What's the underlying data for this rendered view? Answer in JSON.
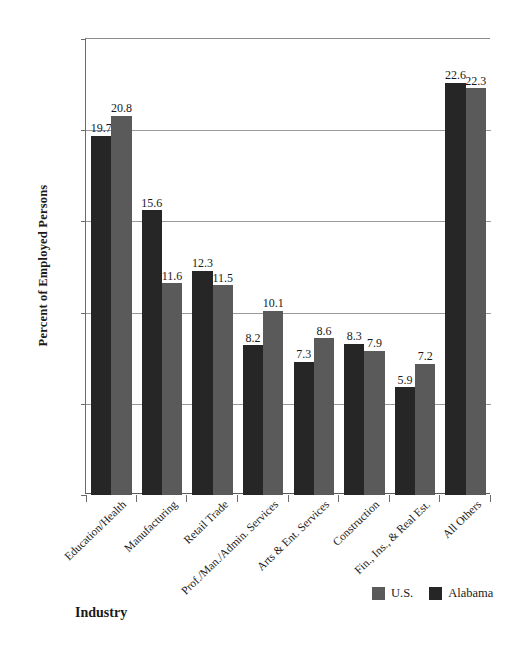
{
  "chart_data": {
    "type": "bar",
    "title": "",
    "xlabel": "Industry",
    "ylabel": "Percent of Employed Persons",
    "ylim": [
      0,
      25
    ],
    "yticks": [
      "0",
      "5",
      "10",
      "15",
      "20",
      "25"
    ],
    "grid": true,
    "legend_position": "bottom-right",
    "categories": [
      "Education/Health",
      "Manufacturing",
      "Retail Trade",
      "Prof./Man./Admin. Services",
      "Arts & Ent. Services",
      "Construction",
      "Fin., Ins., & Real Est.",
      "All Others"
    ],
    "series": [
      {
        "name": "Alabama",
        "color": "#262626",
        "values": [
          19.7,
          15.6,
          12.3,
          8.2,
          7.3,
          8.3,
          5.9,
          22.6
        ],
        "labels": [
          "19.7",
          "15.6",
          "12.3",
          "8.2",
          "7.3",
          "8.3",
          "5.9",
          "22.6"
        ]
      },
      {
        "name": "U.S.",
        "color": "#5a5a5a",
        "values": [
          20.8,
          11.6,
          11.5,
          10.1,
          8.6,
          7.9,
          7.2,
          22.3
        ],
        "labels": [
          "20.8",
          "11.6",
          "11.5",
          "10.1",
          "8.6",
          "7.9",
          "7.2",
          "22.3"
        ]
      }
    ],
    "legend": [
      {
        "label": "U.S.",
        "color": "#5a5a5a"
      },
      {
        "label": "Alabama",
        "color": "#262626"
      }
    ]
  }
}
